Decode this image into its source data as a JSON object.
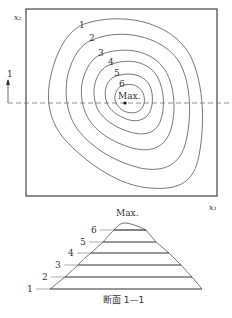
{
  "plan_view": {
    "axis_x_label": "x₁",
    "axis_y_label": "x₂",
    "section_marker_label": "1",
    "max_label": "Max.",
    "contour_labels": [
      "1",
      "2",
      "3",
      "4",
      "5",
      "6"
    ]
  },
  "section_view": {
    "title": "断面 1—1",
    "max_label": "Max.",
    "level_labels": [
      "1",
      "2",
      "3",
      "4",
      "5",
      "6"
    ]
  },
  "colors": {
    "line": "#555555",
    "frame": "#444444",
    "background": "#ffffff"
  }
}
